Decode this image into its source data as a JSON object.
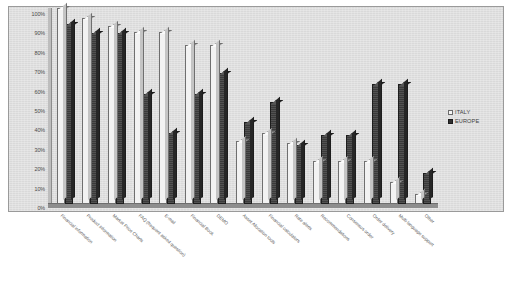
{
  "chart_data": {
    "type": "bar",
    "title": "",
    "xlabel": "",
    "ylabel": "",
    "ylim": [
      0,
      100
    ],
    "grid": false,
    "legend_position": "right",
    "y_ticks": [
      "0%",
      "10%",
      "20%",
      "30%",
      "40%",
      "50%",
      "60%",
      "70%",
      "80%",
      "90%",
      "100%"
    ],
    "categories": [
      "Financial information",
      "Product information",
      "Market Price Charts",
      "FAQ (frequent asked question)",
      "E-mail",
      "Financial Book",
      "DEMO",
      "Asset Allocation tools",
      "Financial calculators",
      "Rate alerts",
      "Recommendations",
      "Consensus order",
      "Order delivery",
      "Multi-language support",
      "Other"
    ],
    "series": [
      {
        "name": "ITALY",
        "color": "#f2f2f2",
        "values": [
          100,
          95,
          91,
          88,
          88,
          81,
          81,
          32,
          36,
          31,
          22,
          22,
          22,
          11,
          5
        ]
      },
      {
        "name": "EUROPE",
        "color": "#3a3a3a",
        "values": [
          92,
          87,
          87,
          56,
          36,
          56,
          67,
          42,
          52,
          30,
          35,
          35,
          61,
          61,
          16
        ]
      }
    ]
  },
  "legend": {
    "entries": [
      {
        "label": "ITALY"
      },
      {
        "label": "EUROPE"
      }
    ]
  }
}
